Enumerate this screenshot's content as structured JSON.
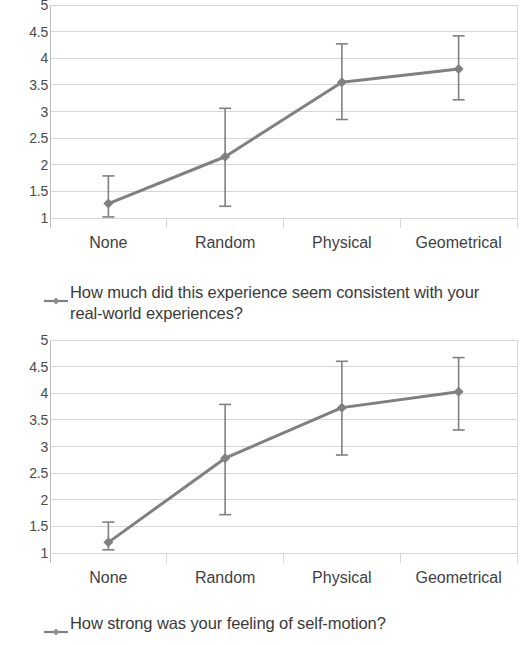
{
  "chart_data": [
    {
      "type": "line",
      "title": "",
      "xlabel": "",
      "ylabel": "",
      "categories": [
        "None",
        "Random",
        "Physical",
        "Geometrical"
      ],
      "values": [
        1.27,
        2.15,
        3.55,
        3.8
      ],
      "error_low": [
        1.02,
        1.22,
        2.85,
        3.22
      ],
      "error_high": [
        1.79,
        3.06,
        4.27,
        4.42
      ],
      "yticks": [
        "1",
        "1.5",
        "2",
        "2.5",
        "3",
        "3.5",
        "4",
        "4.5",
        "5"
      ],
      "ylim": [
        1,
        5
      ],
      "grid": true,
      "legend_position": "bottom",
      "legend": "How much did this experience seem consistent with your real-world experiences?",
      "series_color": "#808080"
    },
    {
      "type": "line",
      "title": "",
      "xlabel": "",
      "ylabel": "",
      "categories": [
        "None",
        "Random",
        "Physical",
        "Geometrical"
      ],
      "values": [
        1.2,
        2.78,
        3.73,
        4.03
      ],
      "error_low": [
        1.06,
        1.72,
        2.84,
        3.31
      ],
      "error_high": [
        1.58,
        3.79,
        4.6,
        4.67
      ],
      "yticks": [
        "1",
        "1.5",
        "2",
        "2.5",
        "3",
        "3.5",
        "4",
        "4.5",
        "5"
      ],
      "ylim": [
        1,
        5
      ],
      "grid": true,
      "legend_position": "bottom",
      "legend": "How strong was your feeling of self-motion?",
      "series_color": "#808080"
    }
  ],
  "charts": [
    {
      "legend_label": "How much did this experience seem consistent with your real-world experiences?",
      "yticks": [
        "5",
        "4.5",
        "4",
        "3.5",
        "3",
        "2.5",
        "2",
        "1.5",
        "1"
      ],
      "xticks": [
        "None",
        "Random",
        "Physical",
        "Geometrical"
      ]
    },
    {
      "legend_label": "How strong was your feeling of self-motion?",
      "yticks": [
        "5",
        "4.5",
        "4",
        "3.5",
        "3",
        "2.5",
        "2",
        "1.5",
        "1"
      ],
      "xticks": [
        "None",
        "Random",
        "Physical",
        "Geometrical"
      ]
    }
  ],
  "colors": {
    "series": "#808080",
    "grid": "#d6d6d6",
    "axis": "#bcbcbc",
    "text": "#3b3b3b"
  }
}
